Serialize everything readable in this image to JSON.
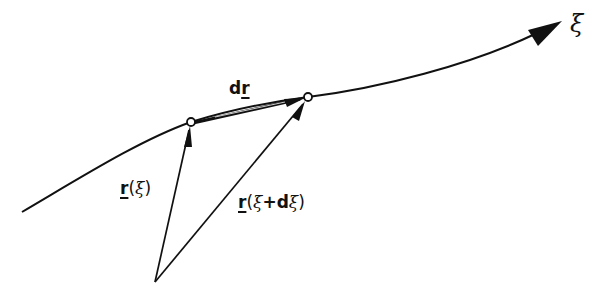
{
  "diagram": {
    "type": "vector-calculus-curve",
    "colors": {
      "ink": "#111111",
      "background": "#ffffff"
    },
    "curve": {
      "parameter_label": "ξ",
      "path_points": [
        [
          22,
          212
        ],
        [
          191,
          122
        ],
        [
          308,
          97
        ],
        [
          560,
          22
        ]
      ]
    },
    "origin": {
      "x": 155,
      "y": 282
    },
    "points": [
      {
        "id": "P1",
        "x": 191,
        "y": 122
      },
      {
        "id": "P2",
        "x": 308,
        "y": 97
      }
    ],
    "vectors": [
      {
        "id": "r_xi",
        "from": "origin",
        "to": "P1",
        "label": "r(ξ)"
      },
      {
        "id": "r_xi_dxi",
        "from": "origin",
        "to": "P2",
        "label": "r(ξ+dξ)"
      },
      {
        "id": "dr",
        "from": "P1",
        "to": "P2",
        "label": "dr"
      }
    ],
    "labels": {
      "axis": "ξ",
      "dr_prefix": "d",
      "dr_vec": "r",
      "r_xi_vec": "r",
      "r_xi_open": "(",
      "r_xi_param": "ξ",
      "r_xi_close": ")",
      "r_xi_dxi_vec": "r",
      "r_xi_dxi_open": "(",
      "r_xi_dxi_param": "ξ",
      "r_xi_dxi_plus": "+d",
      "r_xi_dxi_param2": "ξ",
      "r_xi_dxi_close": ")"
    }
  }
}
